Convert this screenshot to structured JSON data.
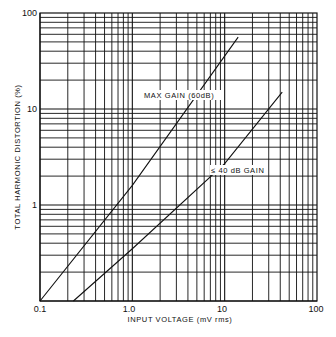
{
  "chart_data": {
    "type": "line",
    "title": "",
    "xlabel": "INPUT VOLTAGE (mV rms)",
    "ylabel": "TOTAL HARMONIC DISTORTION (%)",
    "xscale": "log",
    "yscale": "log",
    "xlim": [
      0.1,
      100
    ],
    "ylim": [
      0.1,
      100
    ],
    "x_ticks": [
      "0.1",
      "1.0",
      "10",
      "100"
    ],
    "y_ticks": [
      "100",
      "10",
      "1",
      "0.1"
    ],
    "grid": true,
    "series": [
      {
        "name": "MAX GAIN (60dB)",
        "x": [
          0.1,
          1.0,
          14
        ],
        "y": [
          0.1,
          1.6,
          56
        ]
      },
      {
        "name": "≤ 40 dB GAIN",
        "x": [
          0.23,
          1.0,
          10,
          42
        ],
        "y": [
          0.1,
          0.35,
          2.7,
          15
        ]
      }
    ],
    "annotations": [
      "MAX GAIN (60dB)",
      "≤ 40 dB GAIN"
    ]
  },
  "labels": {
    "xlabel": "INPUT VOLTAGE (mV rms)",
    "ylabel": "TOTAL HARMONIC DISTORTION (%)",
    "curve1": "MAX GAIN (60dB)",
    "curve2": "≤ 40 dB GAIN",
    "x0": "0.1",
    "x1": "1.0",
    "x2": "10",
    "x3": "100",
    "y0": "100",
    "y1": "10",
    "y2": "1",
    "y3": "0.1"
  }
}
